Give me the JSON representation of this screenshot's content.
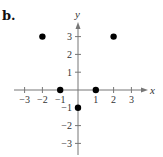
{
  "panel": {
    "label": "b."
  },
  "chart_data": {
    "type": "scatter",
    "title": "",
    "xlabel": "x",
    "ylabel": "y",
    "xlim": [
      -3,
      3
    ],
    "ylim": [
      -3,
      3
    ],
    "grid": false,
    "x_ticks": [
      -3,
      -2,
      -1,
      1,
      2,
      3
    ],
    "y_ticks": [
      -3,
      -2,
      -1,
      1,
      2,
      3
    ],
    "x_tick_labels": [
      "−3",
      "−2",
      "−1",
      "1",
      "2",
      "3"
    ],
    "y_tick_labels": [
      "3",
      "2",
      "1",
      "−1",
      "−2",
      "−3"
    ],
    "series": [
      {
        "name": "points",
        "color": "#000000",
        "points": [
          {
            "x": -2,
            "y": 3
          },
          {
            "x": 2,
            "y": 3
          },
          {
            "x": -1,
            "y": 0
          },
          {
            "x": 1,
            "y": 0
          },
          {
            "x": 0,
            "y": -1
          }
        ]
      }
    ]
  }
}
